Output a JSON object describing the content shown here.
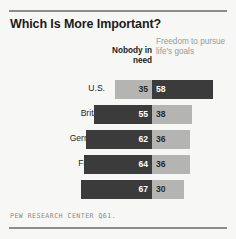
{
  "chart_data": {
    "type": "bar",
    "subtype": "diverging-stacked-bar",
    "title": "Which Is More Important?",
    "xlabel": "",
    "ylabel": "",
    "categories": [
      "U.S.",
      "Britain",
      "Germany",
      "France",
      "Spain"
    ],
    "series": [
      {
        "name": "Nobody in need",
        "side": "left",
        "values": [
          35,
          55,
          62,
          64,
          67
        ]
      },
      {
        "name": "Freedom to pursue life's goals",
        "side": "right",
        "values": [
          58,
          38,
          36,
          36,
          30
        ]
      }
    ],
    "rows": [
      {
        "category": "U.S.",
        "left_value": 35,
        "left_tone": "light",
        "right_value": 58,
        "right_tone": "dark"
      },
      {
        "category": "Britain",
        "left_value": 55,
        "left_tone": "dark",
        "right_value": 38,
        "right_tone": "light"
      },
      {
        "category": "Germany",
        "left_value": 62,
        "left_tone": "dark",
        "right_value": 36,
        "right_tone": "light"
      },
      {
        "category": "France",
        "left_value": 64,
        "left_tone": "dark",
        "right_value": 36,
        "right_tone": "light"
      },
      {
        "category": "Spain",
        "left_value": 67,
        "left_tone": "dark",
        "right_value": 30,
        "right_tone": "light"
      }
    ],
    "legend_position": "top",
    "grid": false,
    "value_unit": "percent",
    "colors": {
      "dark": "#3b3b3b",
      "light": "#b4b4b2",
      "background": "#f7f7f5",
      "rule": "#8d8d8d",
      "title_text": "#1b1b1b",
      "muted_text": "#9a9a96"
    }
  },
  "header": {
    "title": "Which Is More Important?",
    "col_left_label": "Nobody in need",
    "col_right_label": "Freedom to pursue life's goals"
  },
  "footer": {
    "source": "PEW RESEARCH CENTER Q61."
  }
}
